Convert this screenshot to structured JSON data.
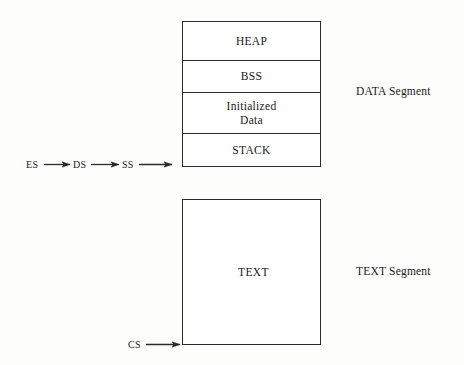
{
  "diagram": {
    "background_color": "#fdfdfc",
    "line_color": "#2b2b2b"
  },
  "data_segment": {
    "side_label": "DATA Segment",
    "rows": [
      {
        "label": "HEAP",
        "line2": ""
      },
      {
        "label": "BSS",
        "line2": ""
      },
      {
        "label": "Initialized",
        "line2": "Data"
      },
      {
        "label": "STACK",
        "line2": ""
      }
    ]
  },
  "text_segment": {
    "side_label": "TEXT Segment",
    "label": "TEXT"
  },
  "registers": {
    "chain": [
      {
        "name": "ES"
      },
      {
        "name": "DS"
      },
      {
        "name": "SS"
      }
    ],
    "code_register": {
      "name": "CS"
    }
  }
}
